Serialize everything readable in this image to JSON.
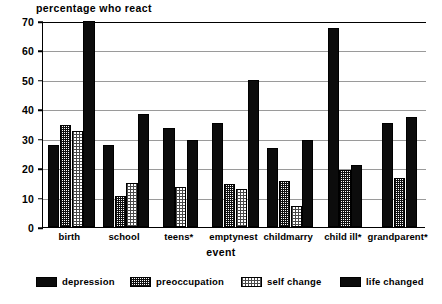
{
  "chart_data": {
    "type": "bar",
    "title": "percentage who react",
    "xlabel": "event",
    "ylabel": "",
    "ylim": [
      0,
      70
    ],
    "yticks": [
      0,
      10,
      20,
      30,
      40,
      50,
      60,
      70
    ],
    "grid": true,
    "legend_position": "bottom",
    "categories": [
      "birth",
      "school",
      "teens*",
      "emptynest",
      "childmarry",
      "child ill*",
      "grandparent*"
    ],
    "series": [
      {
        "name": "depression",
        "color": "#0c0c0c",
        "pattern": "solid-black",
        "values": [
          28,
          28,
          33.5,
          35.5,
          27,
          67.5,
          35.5
        ]
      },
      {
        "name": "preoccupation",
        "color": "#111111",
        "pattern": "dense-checker",
        "values": [
          34.5,
          10.5,
          null,
          14.5,
          15.5,
          19.5,
          16.5
        ]
      },
      {
        "name": "self change",
        "color": "#4a4a4a",
        "pattern": "light-dotted",
        "values": [
          32.5,
          15,
          13.5,
          13,
          7,
          null,
          null
        ]
      },
      {
        "name": "life changed",
        "color": "#0c0c0c",
        "pattern": "solid-black",
        "values": [
          70,
          38.5,
          29.5,
          50,
          29.5,
          21,
          37.5
        ]
      }
    ]
  },
  "legend": {
    "items": [
      {
        "label": "depression"
      },
      {
        "label": "preoccupation"
      },
      {
        "label": "self change"
      },
      {
        "label": "life changed"
      }
    ]
  }
}
